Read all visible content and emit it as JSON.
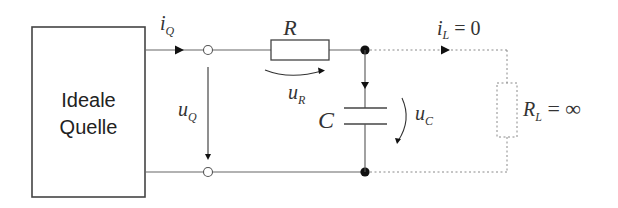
{
  "source_block": {
    "label_line1": "Ideale",
    "label_line2": "Quelle"
  },
  "labels": {
    "iQ": {
      "main": "i",
      "sub": "Q"
    },
    "uQ": {
      "main": "u",
      "sub": "Q"
    },
    "R": {
      "main": "R"
    },
    "uR": {
      "main": "u",
      "sub": "R"
    },
    "C": {
      "main": "C"
    },
    "uC": {
      "main": "u",
      "sub": "C"
    },
    "iL": {
      "main": "i",
      "sub": "L",
      "rest": " = 0"
    },
    "RL": {
      "main": "R",
      "sub": "L",
      "rest": " = ∞"
    }
  },
  "colors": {
    "line": "#555555",
    "dashed": "#8a8a8a",
    "node": "#111111"
  }
}
